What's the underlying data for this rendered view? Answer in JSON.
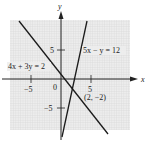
{
  "diagram": {
    "type": "coordinate-graph",
    "axes": {
      "x_label": "x",
      "y_label": "y",
      "origin_label": "0"
    },
    "ticks": {
      "x": [
        {
          "value": -5,
          "label": "−5"
        },
        {
          "value": 5,
          "label": "5"
        }
      ],
      "y": [
        {
          "value": 5,
          "label": "5"
        },
        {
          "value": -5,
          "label": "−5"
        }
      ]
    },
    "lines": [
      {
        "equation": "4x + 3y = 2",
        "color": "#1a1a1a"
      },
      {
        "equation": "5x − y = 12",
        "color": "#1a1a1a"
      }
    ],
    "intersection": {
      "label": "(2, −2)",
      "x": 2,
      "y": -2
    },
    "grid_color": "#d9d9d9"
  }
}
